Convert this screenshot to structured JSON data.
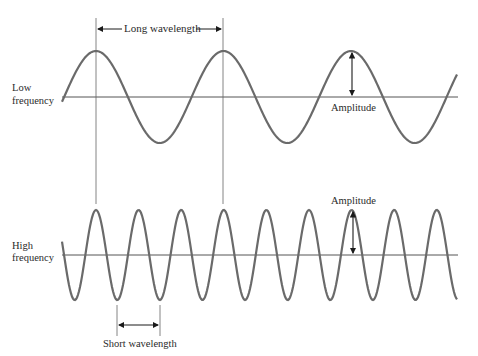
{
  "diagram": {
    "type": "wave comparison",
    "low_wave": {
      "label_line1": "Low",
      "label_line2": "frequency",
      "amplitude_label": "Amplitude",
      "wavelength_label": "Long wavelength",
      "period_px": 127.5,
      "amplitude_px": 46
    },
    "high_wave": {
      "label_line1": "High",
      "label_line2": "frequency",
      "amplitude_label": "Amplitude",
      "wavelength_label": "Short wavelength",
      "period_px": 42.6,
      "amplitude_px": 45
    },
    "colors": {
      "wave": "#6a6a6a",
      "axis": "#555555",
      "arrow": "#1a1a1a",
      "text": "#2a2a2a"
    }
  }
}
